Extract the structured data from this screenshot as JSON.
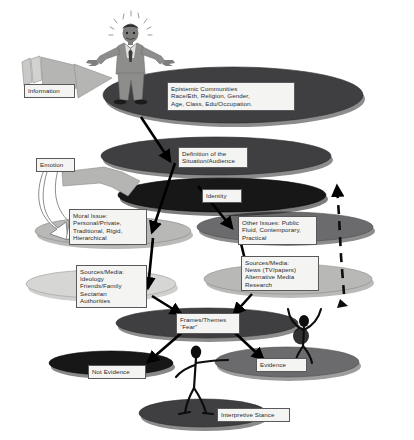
{
  "diagram": {
    "background_color": "#ffffff",
    "palette": {
      "ellipse_dark": "#3f3f41",
      "ellipse_black": "#171717",
      "ellipse_mid": "#6b6b6d",
      "ellipse_light": "#b8b8b6",
      "ellipse_pale": "#d6d6d4",
      "arrow_black": "#000000",
      "arrow_gray": "#a9a9a7",
      "figure_suit": "#8d8d8b",
      "callout_fill": "#f4f4f2",
      "callout_border": "#59595b"
    },
    "inputs": [
      {
        "name": "information",
        "label": "Information",
        "arrow_style": "solid-gray-block"
      },
      {
        "name": "emotion",
        "label": "Emotion",
        "arrow_style": "curved-white-outline"
      }
    ],
    "layers": [
      {
        "name": "epistemic-communities",
        "label": "Epistemic Communities\nRace/Eth, Religion, Gender,\nAge, Class, Edu/Occupation.",
        "shade": "#3f3f41",
        "level": 1
      },
      {
        "name": "definition-of-situation",
        "label": "Definition of the\nSituation/Audience",
        "shade": "#3f3f41",
        "level": 2
      },
      {
        "name": "identity",
        "label": "Identity",
        "shade": "#171717",
        "level": 3
      },
      {
        "name": "moral-issue",
        "label": "Moral Issue:\nPersonal/Private,\nTraditional, Rigid,\nHierarchical",
        "shade": "#b8b8b6",
        "level": 4
      },
      {
        "name": "other-issues",
        "label": "Other Issues: Public\nFluid, Contemporary,\nPractical",
        "shade": "#6b6b6d",
        "level": 4
      },
      {
        "name": "sources-media-ideology",
        "label": "Sources/Media:\nIdeology\nFriends/Family\nSectarian\nAuthorities",
        "shade": "#d6d6d4",
        "level": 5
      },
      {
        "name": "sources-media-news",
        "label": "Sources/Media:\nNews (TV/papers)\nAlternative Media\nResearch",
        "shade": "#b8b8b6",
        "level": 5
      },
      {
        "name": "frames-themes",
        "label": "Frames/Themes\n“Fear”",
        "shade": "#3f3f41",
        "level": 6
      },
      {
        "name": "not-evidence",
        "label": "Not Evidence",
        "shade": "#171717",
        "level": 7
      },
      {
        "name": "evidence",
        "label": "Evidence",
        "shade": "#6b6b6d",
        "level": 7
      },
      {
        "name": "interpretive-stance",
        "label": "Interpretive Stance",
        "shade": "#3f3f41",
        "level": 8
      }
    ],
    "figures": [
      {
        "name": "businessman-figure",
        "style": "gray-suit-shrugging",
        "stands_on": "epistemic-communities"
      },
      {
        "name": "stick-figure-upper",
        "style": "black-arms-raised",
        "stands_on": "evidence"
      },
      {
        "name": "stick-figure-lower",
        "style": "black-arms-out",
        "stands_on": "interpretive-stance"
      }
    ],
    "connectors": [
      {
        "name": "epistemic-to-definition",
        "style": "solid-black-arrow"
      },
      {
        "name": "definition-to-moral",
        "style": "solid-black-arrow"
      },
      {
        "name": "identity-to-other-issues",
        "style": "solid-black-arrow"
      },
      {
        "name": "moral-to-sources-left",
        "style": "solid-black-arrow"
      },
      {
        "name": "other-to-sources-right",
        "style": "solid-black-arrow"
      },
      {
        "name": "sources-left-to-frames",
        "style": "solid-black-arrow"
      },
      {
        "name": "sources-right-to-frames",
        "style": "solid-black-arrow"
      },
      {
        "name": "frames-to-not-evidence",
        "style": "solid-black-arrow"
      },
      {
        "name": "frames-to-evidence",
        "style": "solid-black-arrow"
      },
      {
        "name": "feedback-upward",
        "style": "dashed-black-arrow"
      }
    ]
  }
}
